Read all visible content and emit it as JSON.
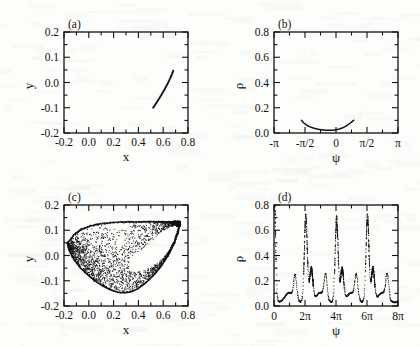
{
  "figure": {
    "background_color": "#fdfdfb",
    "ink_color": "#111111",
    "width": 420,
    "height": 346
  },
  "panels": [
    {
      "tag": "(a)",
      "name": "panel-a",
      "xlabel": "x",
      "ylabel": "y",
      "xticks": [
        "-0.2",
        "0.0",
        "0.2",
        "0.4",
        "0.6",
        "0.8"
      ],
      "yticks": [
        "-0.2",
        "-0.1",
        "0.0",
        "0.1",
        "0.2"
      ]
    },
    {
      "tag": "(b)",
      "name": "panel-b",
      "xlabel": "ψ",
      "ylabel": "ρ",
      "xticks": [
        "-π",
        "-π/2",
        "0",
        "π/2",
        "π"
      ],
      "yticks": [
        "0.0",
        "0.2",
        "0.4",
        "0.6",
        "0.8"
      ]
    },
    {
      "tag": "(c)",
      "name": "panel-c",
      "xlabel": "x",
      "ylabel": "y",
      "xticks": [
        "-0.2",
        "0.0",
        "0.2",
        "0.4",
        "0.6",
        "0.8"
      ],
      "yticks": [
        "-0.2",
        "-0.1",
        "0.0",
        "0.1",
        "0.2"
      ]
    },
    {
      "tag": "(d)",
      "name": "panel-d",
      "xlabel": "ψ",
      "ylabel": "ρ",
      "xticks": [
        "0",
        "2π",
        "4π",
        "6π",
        "8π"
      ],
      "yticks": [
        "0.0",
        "0.2",
        "0.4",
        "0.6",
        "0.8"
      ]
    }
  ],
  "chart_data": [
    {
      "type": "scatter",
      "panel": "(a)",
      "title": "",
      "xlabel": "x",
      "ylabel": "y",
      "xlim": [
        -0.2,
        0.8
      ],
      "ylim": [
        -0.2,
        0.2
      ],
      "xticks": [
        -0.2,
        0.0,
        0.2,
        0.4,
        0.6,
        0.8
      ],
      "yticks": [
        -0.2,
        -0.1,
        0.0,
        0.1,
        0.2
      ],
      "minor_ticks": true,
      "grid": false,
      "legend": "none",
      "description": "single thin slightly-curved arc segment (periodic orbit / fixed-point branch)",
      "series": [
        {
          "name": "arc",
          "marker": "line",
          "x": [
            0.519,
            0.53,
            0.542,
            0.555,
            0.569,
            0.583,
            0.597,
            0.611,
            0.624,
            0.637,
            0.649,
            0.66,
            0.669,
            0.676,
            0.681
          ],
          "y": [
            -0.1,
            -0.092,
            -0.083,
            -0.073,
            -0.062,
            -0.051,
            -0.039,
            -0.027,
            -0.015,
            -0.003,
            0.009,
            0.021,
            0.031,
            0.04,
            0.047
          ]
        }
      ]
    },
    {
      "type": "line",
      "panel": "(b)",
      "title": "",
      "xlabel": "ψ",
      "ylabel": "ρ",
      "xlim": [
        -3.14159,
        3.14159
      ],
      "ylim": [
        0.0,
        0.8
      ],
      "xticks": [
        -3.14159,
        -1.5708,
        0,
        1.5708,
        3.14159
      ],
      "xticklabels": [
        "-π",
        "-π/2",
        "0",
        "π/2",
        "π"
      ],
      "yticks": [
        0.0,
        0.2,
        0.4,
        0.6,
        0.8
      ],
      "minor_ticks": true,
      "grid": false,
      "legend": "none",
      "description": "shallow U-shaped curve confined near rho = 0, spanning roughly psi = -1.75 to +0.9",
      "series": [
        {
          "name": "rho(psi)",
          "x": [
            -1.75,
            -1.64,
            -1.52,
            -1.38,
            -1.22,
            -1.05,
            -0.88,
            -0.7,
            -0.52,
            -0.34,
            -0.16,
            0.02,
            0.2,
            0.38,
            0.55,
            0.7,
            0.82,
            0.9
          ],
          "y": [
            0.1,
            0.081,
            0.066,
            0.053,
            0.043,
            0.035,
            0.029,
            0.025,
            0.022,
            0.021,
            0.022,
            0.026,
            0.033,
            0.044,
            0.059,
            0.076,
            0.091,
            0.101
          ]
        }
      ]
    },
    {
      "type": "scatter",
      "panel": "(c)",
      "title": "",
      "xlabel": "x",
      "ylabel": "y",
      "xlim": [
        -0.2,
        0.8
      ],
      "ylim": [
        -0.2,
        0.2
      ],
      "xticks": [
        -0.2,
        0.0,
        0.2,
        0.4,
        0.6,
        0.8
      ],
      "yticks": [
        -0.2,
        -0.1,
        0.0,
        0.1,
        0.2
      ],
      "minor_ticks": true,
      "grid": false,
      "legend": "none",
      "description": "chaotic attractor: crescent / lobe-shaped point cloud. Dense flat upper edge at y=0.13 running from x=-0.10 to x=0.73, a sharp dense cusp at (0.73,0.13), a heavy solid lower-right boundary arc sweeping from the cusp down to (0.33,-0.15) and back up-left to (-0.17,0.05); interior of the upper lobe is filled with sparse scattered points and the lower-right interior is empty.",
      "boundary_upper": {
        "x": [
          -0.17,
          -0.12,
          -0.06,
          0.01,
          0.09,
          0.18,
          0.28,
          0.38,
          0.48,
          0.57,
          0.65,
          0.71,
          0.735
        ],
        "y": [
          0.05,
          0.082,
          0.103,
          0.117,
          0.125,
          0.13,
          0.133,
          0.134,
          0.134,
          0.134,
          0.133,
          0.132,
          0.131
        ]
      },
      "boundary_lower": {
        "x": [
          0.735,
          0.72,
          0.69,
          0.645,
          0.585,
          0.52,
          0.455,
          0.395,
          0.34,
          0.285,
          0.23,
          0.17,
          0.11,
          0.05,
          -0.01,
          -0.07,
          -0.12,
          -0.16,
          -0.17
        ],
        "y": [
          0.131,
          0.095,
          0.05,
          0.005,
          -0.042,
          -0.08,
          -0.11,
          -0.132,
          -0.144,
          -0.148,
          -0.145,
          -0.135,
          -0.12,
          -0.1,
          -0.076,
          -0.048,
          -0.016,
          0.022,
          0.05
        ]
      },
      "n_points": 2400
    },
    {
      "type": "scatter",
      "panel": "(d)",
      "title": "",
      "xlabel": "ψ",
      "ylabel": "ρ",
      "xlim": [
        0,
        25.1327
      ],
      "ylim": [
        0.0,
        0.8
      ],
      "xticks": [
        0,
        6.2832,
        12.5664,
        18.8496,
        25.1327
      ],
      "xticklabels": [
        "0",
        "2π",
        "4π",
        "6π",
        "8π"
      ],
      "yticks": [
        0.0,
        0.2,
        0.4,
        0.6,
        0.8
      ],
      "minor_ticks": true,
      "grid": false,
      "legend": "none",
      "description": "dotted rho(psi) trace with period 2pi: one tall narrow spike reaching about 0.70 just after each multiple of 2pi, preceded by a small secondary peak of about 0.19, with broad low valleys near rho = 0.03.",
      "baseline": 0.03,
      "period": 6.2832,
      "tall_peaks": [
        {
          "psi": 0.0,
          "rho": 0.46,
          "note": "truncated at left axis"
        },
        {
          "psi": 6.45,
          "rho": 0.7
        },
        {
          "psi": 12.7,
          "rho": 0.68
        },
        {
          "psi": 18.95,
          "rho": 0.7
        }
      ],
      "small_peaks": [
        {
          "psi": 4.3,
          "rho": 0.19
        },
        {
          "psi": 10.45,
          "rho": 0.19
        },
        {
          "psi": 16.7,
          "rho": 0.19
        },
        {
          "psi": 22.95,
          "rho": 0.19
        }
      ],
      "shoulder_peaks": [
        {
          "psi": 7.55,
          "rho": 0.27
        },
        {
          "psi": 13.8,
          "rho": 0.27
        },
        {
          "psi": 20.05,
          "rho": 0.27
        }
      ]
    }
  ]
}
